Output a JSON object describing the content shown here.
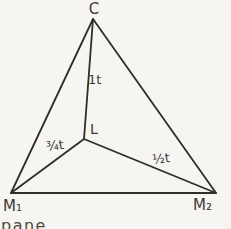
{
  "figure": {
    "type": "triangle-with-interior-point",
    "vertices": {
      "top": "C",
      "bottom_left": "M₁",
      "bottom_right": "M₂"
    },
    "interior_point": "L",
    "segment_labels": {
      "c_to_l": "1t",
      "m1_to_l": "¾t",
      "l_to_m2": "½t"
    },
    "partial_caption": "pane",
    "colors": {
      "background": "#f6f5f2",
      "triangle_fill": "#dcdcd9",
      "line": "#2e2d2a",
      "text": "#3b3a37"
    }
  }
}
